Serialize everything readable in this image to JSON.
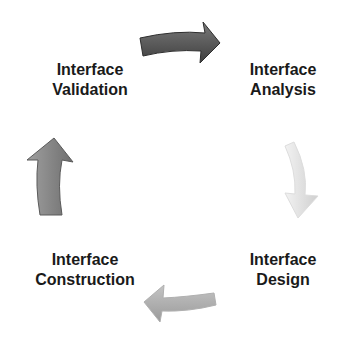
{
  "diagram": {
    "type": "cycle",
    "stages": [
      {
        "id": "analysis",
        "line1": "Interface",
        "line2": "Analysis"
      },
      {
        "id": "design",
        "line1": "Interface",
        "line2": "Design"
      },
      {
        "id": "construction",
        "line1": "Interface",
        "line2": "Construction"
      },
      {
        "id": "validation",
        "line1": "Interface",
        "line2": "Validation"
      }
    ],
    "arrows": [
      {
        "from": "validation",
        "to": "analysis",
        "direction": "right",
        "color": "#555555"
      },
      {
        "from": "analysis",
        "to": "design",
        "direction": "down",
        "color": "#d8d8d8"
      },
      {
        "from": "design",
        "to": "construction",
        "direction": "left",
        "color": "#a8a8a8"
      },
      {
        "from": "construction",
        "to": "validation",
        "direction": "up",
        "color": "#888888"
      }
    ]
  }
}
